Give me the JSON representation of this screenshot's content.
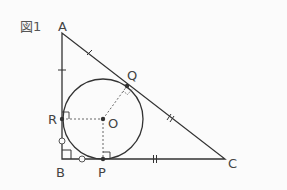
{
  "figure": {
    "caption": "図1",
    "caption_pos": [
      20,
      31
    ]
  },
  "points": {
    "A": {
      "label": "A",
      "x": 62,
      "y": 33,
      "lx": 58,
      "ly": 31
    },
    "B": {
      "label": "B",
      "x": 62,
      "y": 159,
      "lx": 56,
      "ly": 177
    },
    "C": {
      "label": "C",
      "x": 225,
      "y": 159,
      "lx": 228,
      "ly": 168
    },
    "O": {
      "label": "O",
      "x": 103,
      "y": 119,
      "lx": 108,
      "ly": 128
    },
    "P": {
      "label": "P",
      "x": 103,
      "y": 159,
      "lx": 98,
      "ly": 177
    },
    "Q": {
      "label": "Q",
      "x": 127,
      "y": 86,
      "lx": 127,
      "ly": 80
    },
    "R": {
      "label": "R",
      "x": 62,
      "y": 119,
      "lx": 48,
      "ly": 124
    }
  },
  "circle": {
    "cx": 103,
    "cy": 119,
    "r": 40
  },
  "colors": {
    "stroke": "#333333",
    "dotted": "#666666",
    "background": "#fbfbfb"
  }
}
